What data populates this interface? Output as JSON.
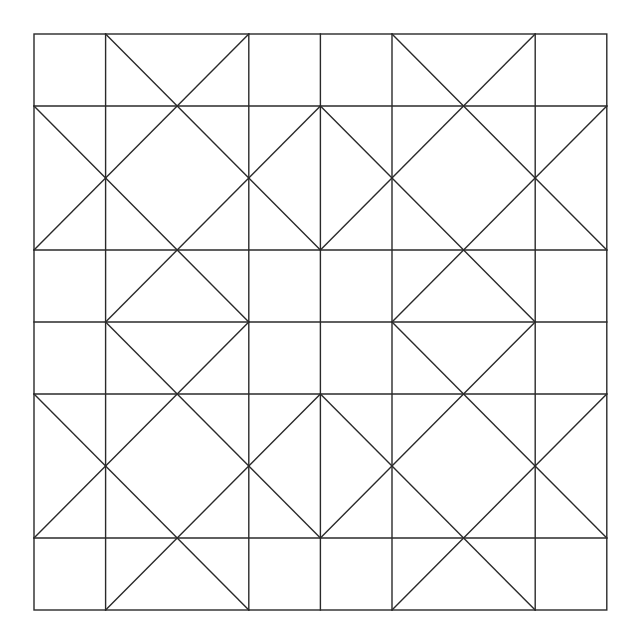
{
  "diagram": {
    "type": "geometric-quilt-pattern",
    "background": "#ffffff",
    "stroke_color": "#2a2a2a",
    "stroke_width": 1.4,
    "origin_px": [
      34,
      34
    ],
    "unit_px_x": 71.6,
    "unit_px_y": 72.0,
    "grid_units": 8,
    "vertical_lines_units": [
      0,
      1,
      3,
      4,
      5,
      7,
      8
    ],
    "horizontal_lines_units": [
      0,
      1,
      3,
      4,
      5,
      7,
      8
    ],
    "blocks": [
      {
        "name": "top-left",
        "offset": [
          0,
          0
        ]
      },
      {
        "name": "top-right",
        "offset": [
          4,
          0
        ]
      },
      {
        "name": "bottom-left",
        "offset": [
          0,
          4
        ]
      },
      {
        "name": "bottom-right",
        "offset": [
          4,
          4
        ]
      }
    ],
    "block_diagonals_units": [
      [
        [
          1,
          0
        ],
        [
          4,
          3
        ]
      ],
      [
        [
          3,
          0
        ],
        [
          0,
          3
        ]
      ],
      [
        [
          0,
          1
        ],
        [
          3,
          4
        ]
      ],
      [
        [
          4,
          1
        ],
        [
          1,
          4
        ]
      ]
    ]
  }
}
